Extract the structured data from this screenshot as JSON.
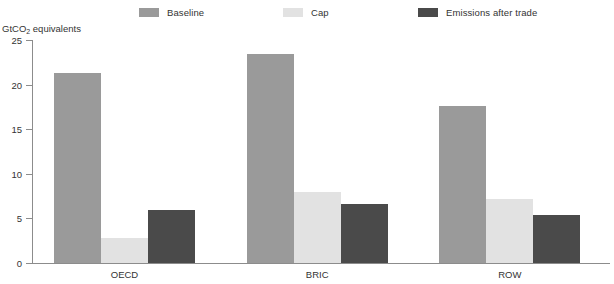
{
  "chart_data": {
    "type": "bar",
    "title": "",
    "subtitle": "",
    "xlabel": "",
    "ylabel": "GtCO2 equivalents",
    "ylabel_parts": {
      "pre": "GtCO",
      "sub": "2",
      "post": " equivalents"
    },
    "categories": [
      "OECD",
      "BRIC",
      "ROW"
    ],
    "series": [
      {
        "name": "Baseline",
        "color": "#9a9a9a",
        "values": [
          21.3,
          23.4,
          17.6
        ]
      },
      {
        "name": "Cap",
        "color": "#e2e2e2",
        "values": [
          2.8,
          8.0,
          7.2
        ]
      },
      {
        "name": "Emissions after trade",
        "color": "#4a4a4a",
        "values": [
          5.9,
          6.6,
          5.4
        ]
      }
    ],
    "ylim": [
      0,
      25
    ],
    "yticks": [
      0,
      5,
      10,
      15,
      20,
      25
    ],
    "ytick_labels": [
      "0",
      "5",
      "10",
      "15",
      "20",
      "25"
    ],
    "grid": false,
    "legend_position": "top"
  },
  "legend": {
    "items": [
      {
        "label": "Baseline",
        "color": "#9a9a9a"
      },
      {
        "label": "Cap",
        "color": "#e2e2e2"
      },
      {
        "label": "Emissions after trade",
        "color": "#4a4a4a"
      }
    ]
  },
  "axis": {
    "y_title": "GtCO2 equivalents",
    "y_title_pre": "GtCO",
    "y_title_sub": "2",
    "y_title_post": " equivalents",
    "tick_0": "0",
    "tick_1": "5",
    "tick_2": "10",
    "tick_3": "15",
    "tick_4": "20",
    "tick_5": "25"
  },
  "categories": {
    "c0": "OECD",
    "c1": "BRIC",
    "c2": "ROW"
  },
  "colors": {
    "baseline": "#9a9a9a",
    "cap": "#e2e2e2",
    "emissions": "#4a4a4a",
    "axis": "#8c8c8c",
    "text": "#333333",
    "background": "#ffffff"
  }
}
